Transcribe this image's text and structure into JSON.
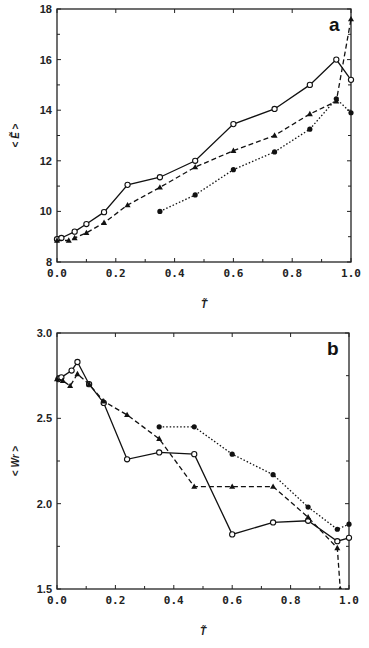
{
  "chart_data": [
    {
      "type": "line",
      "panel_label": "a",
      "title": "",
      "xlabel": "T̃",
      "ylabel": "< Ẽ >",
      "xlim": [
        0.0,
        1.0
      ],
      "ylim": [
        8,
        18
      ],
      "xticks": [
        "0.0",
        "0.2",
        "0.4",
        "0.6",
        "0.8",
        "1.0"
      ],
      "yticks": [
        "8",
        "10",
        "12",
        "14",
        "16",
        "18"
      ],
      "grid": false,
      "legend": null,
      "series": [
        {
          "name": "open circles (solid)",
          "marker": "open-circle",
          "line": "solid",
          "x": [
            0.0,
            0.015,
            0.06,
            0.1,
            0.16,
            0.24,
            0.35,
            0.47,
            0.6,
            0.74,
            0.86,
            0.95,
            1.0
          ],
          "values": [
            8.9,
            8.95,
            9.2,
            9.5,
            9.97,
            11.05,
            11.35,
            12.0,
            13.45,
            14.05,
            15.0,
            16.0,
            15.2
          ]
        },
        {
          "name": "filled triangles (dashed)",
          "marker": "filled-triangle",
          "line": "dashed",
          "x": [
            0.0,
            0.04,
            0.06,
            0.1,
            0.16,
            0.24,
            0.35,
            0.47,
            0.6,
            0.74,
            0.86,
            0.95,
            1.0
          ],
          "values": [
            8.85,
            8.85,
            8.95,
            9.15,
            9.55,
            10.25,
            10.95,
            11.75,
            12.4,
            13.0,
            13.85,
            14.35,
            17.6
          ]
        },
        {
          "name": "filled circles (dotted)",
          "marker": "filled-circle",
          "line": "dotted",
          "x": [
            0.35,
            0.47,
            0.6,
            0.74,
            0.86,
            0.95,
            1.0
          ],
          "values": [
            10.0,
            10.65,
            11.65,
            12.35,
            13.25,
            14.45,
            13.9
          ]
        }
      ]
    },
    {
      "type": "line",
      "panel_label": "b",
      "title": "",
      "xlabel": "T̃",
      "ylabel": "< Wr >",
      "xlim": [
        0.0,
        1.0
      ],
      "ylim": [
        1.5,
        3.0
      ],
      "xticks": [
        "0.0",
        "0.2",
        "0.4",
        "0.6",
        "0.8",
        "1.0"
      ],
      "yticks": [
        "1.5",
        "2.0",
        "2.5",
        "3.0"
      ],
      "grid": false,
      "legend": null,
      "series": [
        {
          "name": "open circles (solid)",
          "marker": "open-circle",
          "line": "solid",
          "x": [
            0.005,
            0.015,
            0.05,
            0.07,
            0.11,
            0.16,
            0.24,
            0.35,
            0.47,
            0.6,
            0.74,
            0.86,
            0.96,
            1.0
          ],
          "values": [
            2.73,
            2.74,
            2.78,
            2.83,
            2.7,
            2.59,
            2.26,
            2.3,
            2.29,
            1.82,
            1.89,
            1.9,
            1.78,
            1.8
          ]
        },
        {
          "name": "filled triangles (dashed)",
          "marker": "filled-triangle",
          "line": "dashed",
          "x": [
            0.0,
            0.02,
            0.045,
            0.07,
            0.11,
            0.16,
            0.24,
            0.35,
            0.47,
            0.6,
            0.74,
            0.86,
            0.96,
            0.97
          ],
          "values": [
            2.73,
            2.72,
            2.69,
            2.76,
            2.7,
            2.6,
            2.52,
            2.38,
            2.1,
            2.1,
            2.1,
            1.92,
            1.74,
            1.5
          ]
        },
        {
          "name": "filled circles (dotted)",
          "marker": "filled-circle",
          "line": "dotted",
          "x": [
            0.35,
            0.47,
            0.6,
            0.74,
            0.86,
            0.96,
            1.0
          ],
          "values": [
            2.45,
            2.45,
            2.29,
            2.17,
            1.98,
            1.85,
            1.88
          ]
        }
      ]
    }
  ]
}
